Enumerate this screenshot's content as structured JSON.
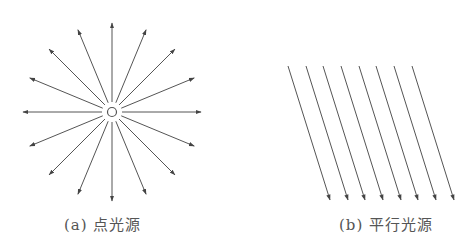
{
  "figure": {
    "panels": [
      {
        "id": "a",
        "caption": "(a) 点光源",
        "type": "point-light-source",
        "center": [
          112,
          112
        ],
        "ray_count": 16,
        "ray_inner_radius": 10,
        "ray_outer_radius": 89,
        "center_marker_radius": 4.5
      },
      {
        "id": "b",
        "caption": "(b) 平行光源",
        "type": "parallel-light-source",
        "ray_count": 8,
        "start_x": [
          288,
          306,
          323,
          341,
          359,
          376,
          394,
          412
        ],
        "start_y": 66,
        "dx": 42,
        "dy": 134
      }
    ],
    "colors": {
      "line": "#555555",
      "background": "#ffffff"
    }
  }
}
